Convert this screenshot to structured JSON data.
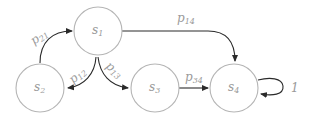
{
  "diagram": {
    "type": "markov-chain",
    "nodes": [
      {
        "id": "s1",
        "label": "s",
        "sub": "1"
      },
      {
        "id": "s2",
        "label": "s",
        "sub": "2"
      },
      {
        "id": "s3",
        "label": "s",
        "sub": "3"
      },
      {
        "id": "s4",
        "label": "s",
        "sub": "4"
      }
    ],
    "edges": [
      {
        "from": "s2",
        "to": "s1",
        "label": "p",
        "sub": "21"
      },
      {
        "from": "s1",
        "to": "s2",
        "label": "p",
        "sub": "12"
      },
      {
        "from": "s1",
        "to": "s3",
        "label": "p",
        "sub": "13"
      },
      {
        "from": "s1",
        "to": "s4",
        "label": "p",
        "sub": "14"
      },
      {
        "from": "s3",
        "to": "s4",
        "label": "p",
        "sub": "34"
      },
      {
        "from": "s4",
        "to": "s4",
        "label": "1",
        "sub": ""
      }
    ]
  }
}
